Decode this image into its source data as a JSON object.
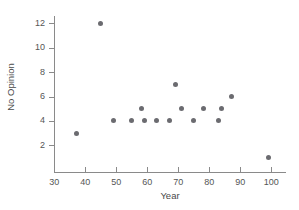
{
  "chart_data": {
    "type": "scatter",
    "title": "",
    "xlabel": "Year",
    "ylabel": "No Opinion",
    "xlim": [
      28,
      103
    ],
    "ylim": [
      0.5,
      12.8
    ],
    "grid": false,
    "legend": "none",
    "marker": {
      "shape": "circle",
      "color": "#6b6b70",
      "size_px": 5
    },
    "axis_color": "#8a8a8a",
    "text_color": "#555555",
    "background": "#ffffff",
    "xticks": [
      30,
      40,
      50,
      60,
      70,
      80,
      90,
      100
    ],
    "yticks": [
      2,
      4,
      6,
      8,
      10,
      12
    ],
    "xtick_labels": [
      "30",
      "40",
      "50",
      "60",
      "70",
      "80",
      "90",
      "100"
    ],
    "ytick_labels": [
      "2",
      "4",
      "6",
      "8",
      "10",
      "12"
    ],
    "points": [
      {
        "x": 37,
        "y": 3
      },
      {
        "x": 45,
        "y": 12
      },
      {
        "x": 49,
        "y": 4
      },
      {
        "x": 55,
        "y": 4
      },
      {
        "x": 58,
        "y": 5
      },
      {
        "x": 59,
        "y": 4
      },
      {
        "x": 63,
        "y": 4
      },
      {
        "x": 67,
        "y": 4
      },
      {
        "x": 69,
        "y": 7
      },
      {
        "x": 71,
        "y": 5
      },
      {
        "x": 75,
        "y": 4
      },
      {
        "x": 78,
        "y": 5
      },
      {
        "x": 83,
        "y": 4
      },
      {
        "x": 84,
        "y": 5
      },
      {
        "x": 87,
        "y": 6
      },
      {
        "x": 99,
        "y": 1
      }
    ]
  }
}
